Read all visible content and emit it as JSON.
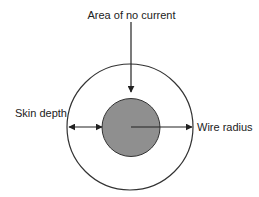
{
  "diagram": {
    "labels": {
      "top": "Area of no current",
      "left": "Skin depth",
      "right": "Wire radius"
    },
    "colors": {
      "stroke": "#222222",
      "inner_fill": "#8f8f8f",
      "background": "#ffffff"
    },
    "shapes": {
      "outer_circle": {
        "cx": 130,
        "cy": 127,
        "r": 63,
        "meaning": "wire cross-section"
      },
      "inner_circle": {
        "cx": 131,
        "cy": 127.5,
        "r": 29,
        "meaning": "area of no current"
      }
    },
    "arrows": [
      {
        "name": "area-of-no-current-arrow",
        "from": [
          131,
          22
        ],
        "to": [
          131,
          92
        ],
        "heads": "end"
      },
      {
        "name": "skin-depth-arrow",
        "from": [
          68,
          127
        ],
        "to": [
          102,
          127
        ],
        "heads": "both"
      },
      {
        "name": "wire-radius-arrow",
        "from": [
          131,
          127
        ],
        "to": [
          192,
          127
        ],
        "heads": "end"
      }
    ]
  }
}
